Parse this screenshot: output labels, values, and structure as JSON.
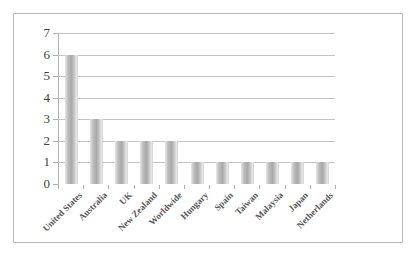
{
  "chart_data": {
    "type": "bar",
    "title": "",
    "subtitle": "",
    "xlabel": "",
    "ylabel": "",
    "categories": [
      "United States",
      "Australia",
      "UK",
      "New Zealand",
      "Worldwide",
      "Hungary",
      "Spain",
      "Taiwan",
      "Malaysia",
      "Japan",
      "Netherlands"
    ],
    "values": [
      6,
      3,
      2,
      2,
      2,
      1,
      1,
      1,
      1,
      1,
      1
    ],
    "ylim": [
      0,
      7
    ],
    "ytick_labels": [
      "0",
      "1",
      "2",
      "3",
      "4",
      "5",
      "6",
      "7"
    ],
    "ytick_values": [
      0,
      1,
      2,
      3,
      4,
      5,
      6,
      7
    ],
    "grid": true,
    "legend": false,
    "legend_position": "none",
    "series": [
      {
        "name": "",
        "values": [
          6,
          3,
          2,
          2,
          2,
          1,
          1,
          1,
          1,
          1,
          1
        ]
      }
    ]
  },
  "style": {
    "bar_color": "#a9a9a9",
    "bar_edge_color": "#d8d8d8",
    "gridline_color": "#c4c4c4",
    "axis_color": "#b0b0b0",
    "frame_color": "#b9b9b9",
    "tick_label_color": "#3f3f3f",
    "category_label_color": "#555555",
    "background": "#ffffff"
  }
}
